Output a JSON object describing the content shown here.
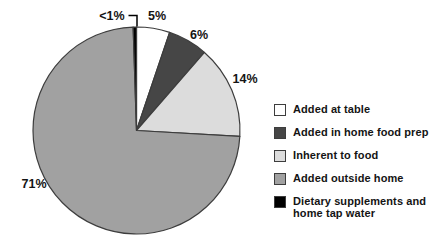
{
  "figure": {
    "background": "#ffffff"
  },
  "chart_data": {
    "type": "pie",
    "title": "",
    "unit": "percent",
    "direction": "clockwise",
    "start_angle_deg": -90,
    "legend_position": "right",
    "outline_color": "#3d3d3d",
    "leader_line_color": "#000000",
    "slices": [
      {
        "legend_label": "Added at table",
        "display_label": "5%",
        "value": 5,
        "color": "#ffffff"
      },
      {
        "legend_label": "Added in home food prep",
        "display_label": "6%",
        "value": 6,
        "color": "#464646"
      },
      {
        "legend_label": "Inherent to food",
        "display_label": "14%",
        "value": 14,
        "color": "#dcdcdc"
      },
      {
        "legend_label": "Added outside home",
        "display_label": "71%",
        "value": 71,
        "color": "#a1a1a1"
      },
      {
        "legend_label": "Dietary supplements and\nhome tap water",
        "display_label": "<1%",
        "value": 0.5,
        "color": "#000000"
      }
    ]
  }
}
